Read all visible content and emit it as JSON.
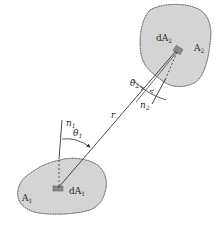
{
  "diagram": {
    "type": "view-factor-geometry",
    "colors": {
      "surface_fill": "#d4d4d4",
      "surface_edge": "#6a6a6a",
      "element_fill": "#8a8a8a",
      "line": "#333333",
      "background": "#ffffff"
    },
    "surfaces": [
      {
        "id": "A1",
        "label": "A",
        "subscript": "1"
      },
      {
        "id": "A2",
        "label": "A",
        "subscript": "2"
      }
    ],
    "elements": [
      {
        "id": "dA1",
        "label": "dA",
        "subscript": "1"
      },
      {
        "id": "dA2",
        "label": "dA",
        "subscript": "2"
      }
    ],
    "normals": [
      {
        "id": "n1",
        "label": "n",
        "subscript": "1"
      },
      {
        "id": "n2",
        "label": "n",
        "subscript": "2"
      }
    ],
    "angles": [
      {
        "id": "theta1",
        "label": "θ",
        "subscript": "1"
      },
      {
        "id": "theta2",
        "label": "θ",
        "subscript": "2"
      }
    ],
    "distance": {
      "id": "r",
      "label": "r"
    }
  }
}
